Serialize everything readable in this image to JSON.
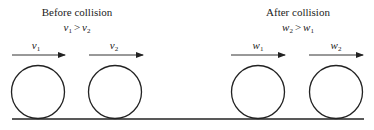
{
  "diagram": {
    "before": {
      "title": "Before collision",
      "condition": {
        "left": "v",
        "left_sub": "1",
        "op": ">",
        "right": "v",
        "right_sub": "2"
      },
      "balls": [
        {
          "label": "v",
          "sub": "1",
          "arrow": "right"
        },
        {
          "label": "v",
          "sub": "2",
          "arrow": "right"
        }
      ]
    },
    "after": {
      "title": "After collision",
      "condition": {
        "left": "w",
        "left_sub": "2",
        "op": ">",
        "right": "w",
        "right_sub": "1"
      },
      "balls": [
        {
          "label": "w",
          "sub": "1",
          "arrow": "right"
        },
        {
          "label": "w",
          "sub": "2",
          "arrow": "right"
        }
      ]
    },
    "colors": {
      "stroke": "#222222",
      "arrow": "#333333",
      "background": "#ffffff"
    }
  }
}
